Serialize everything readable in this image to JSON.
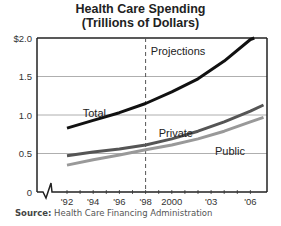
{
  "chart_data": {
    "type": "line",
    "title": "Health Care Spending",
    "subtitle": "(Trillions of Dollars)",
    "xlabel": "",
    "ylabel": "",
    "ylim": [
      0,
      2.0
    ],
    "xlim": [
      1989.7,
      2007
    ],
    "yticks": [
      0,
      0.5,
      1.0,
      1.5,
      2.0
    ],
    "ytick_labels": [
      "0",
      "0.5",
      "1.0",
      "1.5",
      "$2.0"
    ],
    "xticks": [
      1992,
      1994,
      1996,
      1998,
      2000,
      2003,
      2006
    ],
    "xtick_labels": [
      "'92",
      "'94",
      "'96",
      "'98",
      "2000",
      "'03",
      "'06"
    ],
    "minor_xticks": [
      1992,
      1993,
      1994,
      1995,
      1996,
      1997,
      1998,
      1999,
      2000,
      2001,
      2002,
      2003,
      2004,
      2005,
      2006
    ],
    "grid": "horizontal",
    "projection_start": 1998,
    "annotations": [
      {
        "text": "Projections",
        "x": 1998.4,
        "y": 1.83
      }
    ],
    "series": [
      {
        "name": "Total",
        "color": "#111111",
        "x": [
          1992,
          1994,
          1996,
          1998,
          2000,
          2002,
          2004,
          2006,
          2006.3
        ],
        "y": [
          0.83,
          0.93,
          1.03,
          1.15,
          1.3,
          1.47,
          1.7,
          1.98,
          2.0
        ],
        "label_pos": {
          "x": 1993.2,
          "y": 1.02
        }
      },
      {
        "name": "Private",
        "color": "#555555",
        "x": [
          1992,
          1994,
          1996,
          1998,
          2000,
          2002,
          2004,
          2006,
          2007
        ],
        "y": [
          0.47,
          0.52,
          0.56,
          0.61,
          0.69,
          0.79,
          0.91,
          1.05,
          1.13
        ],
        "label_pos": {
          "x": 1999.0,
          "y": 0.76
        }
      },
      {
        "name": "Public",
        "color": "#999999",
        "x": [
          1992,
          1994,
          1996,
          1998,
          2000,
          2002,
          2004,
          2006,
          2007
        ],
        "y": [
          0.35,
          0.42,
          0.48,
          0.55,
          0.61,
          0.69,
          0.79,
          0.91,
          0.97
        ],
        "label_pos": {
          "x": 2003.3,
          "y": 0.53
        }
      }
    ]
  },
  "source": {
    "label": "Source:",
    "text": " Health Care Financing Administration"
  }
}
